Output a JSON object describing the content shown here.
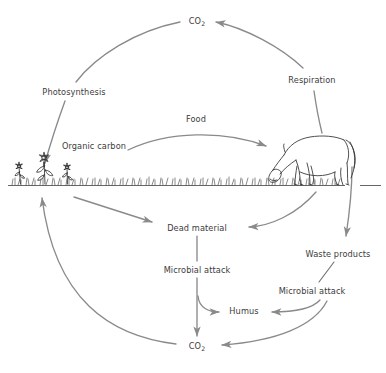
{
  "diagram": {
    "type": "cycle-diagram",
    "palette": {
      "arrow": "#8a8a8a",
      "text": "#3c3c3c",
      "artwork": "#303030",
      "ground": "#555555",
      "background": "#ffffff"
    },
    "nodes": [
      {
        "id": "co2-top",
        "label": "CO",
        "sub": "2",
        "x": 197,
        "y": 21
      },
      {
        "id": "photosynthesis",
        "label": "Photosynthesis",
        "x": 74,
        "y": 92
      },
      {
        "id": "respiration",
        "label": "Respiration",
        "x": 312,
        "y": 80
      },
      {
        "id": "food",
        "label": "Food",
        "x": 196,
        "y": 119
      },
      {
        "id": "organic-carbon",
        "label": "Organic carbon",
        "x": 94,
        "y": 146
      },
      {
        "id": "dead-material",
        "label": "Dead material",
        "x": 197,
        "y": 228
      },
      {
        "id": "microbial-attack-1",
        "label": "Microbial attack",
        "x": 197,
        "y": 270
      },
      {
        "id": "waste-products",
        "label": "Waste products",
        "x": 338,
        "y": 254
      },
      {
        "id": "microbial-attack-2",
        "label": "Microbial attack",
        "x": 312,
        "y": 291
      },
      {
        "id": "humus",
        "label": "Humus",
        "x": 244,
        "y": 311
      },
      {
        "id": "co2-bottom",
        "label": "CO",
        "sub": "2",
        "x": 197,
        "y": 346
      }
    ],
    "edges": [
      {
        "id": "photosynthesis-to-co2-top",
        "from": "photosynthesis",
        "to": "co2-top",
        "style": "curved-arrow"
      },
      {
        "id": "respiration-to-co2-top",
        "from": "respiration",
        "to": "co2-top",
        "style": "curved-arrow"
      },
      {
        "id": "photosynthesis-to-plants",
        "from": "photosynthesis",
        "to": "plants",
        "style": "curved-arrow"
      },
      {
        "id": "horse-to-respiration",
        "from": "horse",
        "to": "respiration",
        "style": "curved-line"
      },
      {
        "id": "organic-carbon-to-horse",
        "from": "organic-carbon",
        "to": "horse",
        "style": "curved-arrow",
        "edge_label": "Food"
      },
      {
        "id": "plants-to-dead-material",
        "from": "plants",
        "to": "dead-material",
        "style": "curved-arrow"
      },
      {
        "id": "horse-to-dead-material",
        "from": "horse",
        "to": "dead-material",
        "style": "curved-arrow"
      },
      {
        "id": "horse-to-waste-products",
        "from": "horse",
        "to": "waste-products",
        "style": "straight-arrow"
      },
      {
        "id": "dead-material-to-microbial-1",
        "from": "dead-material",
        "to": "microbial-attack-1",
        "style": "straight-line"
      },
      {
        "id": "microbial-1-to-co2-bottom",
        "from": "microbial-attack-1",
        "to": "co2-bottom",
        "style": "straight-arrow"
      },
      {
        "id": "microbial-1-to-humus",
        "from": "microbial-attack-1",
        "to": "humus",
        "style": "curved-arrow"
      },
      {
        "id": "waste-products-to-microbial-2",
        "from": "waste-products",
        "to": "microbial-attack-2",
        "style": "straight-line"
      },
      {
        "id": "microbial-2-to-humus",
        "from": "microbial-attack-2",
        "to": "humus",
        "style": "curved-arrow"
      },
      {
        "id": "microbial-2-to-co2-bottom",
        "from": "microbial-attack-2",
        "to": "co2-bottom",
        "style": "curved-arrow"
      },
      {
        "id": "co2-bottom-to-plants",
        "from": "co2-bottom",
        "to": "plants",
        "style": "curved-arrow"
      }
    ],
    "artwork": [
      {
        "id": "flowers",
        "name": "flower-cluster",
        "description": "three daisy-like flowers at left of ground line"
      },
      {
        "id": "grass",
        "name": "grass-tufts",
        "description": "grass tufts along the ground line"
      },
      {
        "id": "horse",
        "name": "grazing-horse",
        "description": "horse grazing with head lowered, facing left"
      },
      {
        "id": "ground",
        "name": "ground-line",
        "description": "horizontal soil surface line"
      }
    ]
  }
}
